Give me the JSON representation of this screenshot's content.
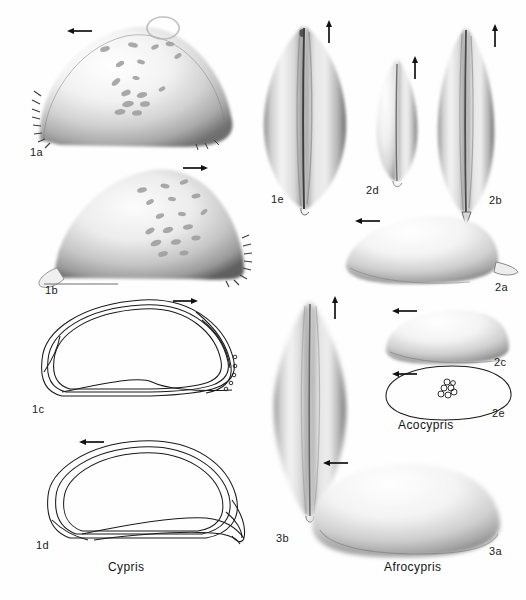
{
  "plate": {
    "width": 526,
    "height": 600,
    "background": "#ffffff",
    "ink": "#1a1a1a",
    "style": "grayscale airbrush scientific illustration of ostracod carapaces"
  },
  "genera": [
    {
      "id": "cypris",
      "label": "Cypris",
      "x": 108,
      "y": 566
    },
    {
      "id": "acocypris",
      "label": "Acocypris",
      "x": 398,
      "y": 424
    },
    {
      "id": "afrocypris",
      "label": "Afrocypris",
      "x": 384,
      "y": 566
    }
  ],
  "figures": [
    {
      "id": "1a",
      "label": "1a",
      "label_x": 30,
      "label_y": 152,
      "view": "lateral",
      "taxon": "Cypris",
      "spines": true,
      "pits": true,
      "arrow": {
        "dir": "left",
        "x": 67,
        "y": 26
      },
      "cx": 131,
      "cy": 86,
      "rx": 96,
      "ry": 58
    },
    {
      "id": "1b",
      "label": "1b",
      "label_x": 45,
      "label_y": 290,
      "view": "lateral",
      "taxon": "Cypris",
      "spines": true,
      "pits": true,
      "arrow": {
        "dir": "right",
        "x": 182,
        "y": 163
      },
      "cx": 148,
      "cy": 221,
      "rx": 95,
      "ry": 56
    },
    {
      "id": "1c",
      "label": "1c",
      "label_x": 32,
      "label_y": 409,
      "view": "outline",
      "taxon": "Cypris",
      "arrow": {
        "dir": "right",
        "x": 172,
        "y": 296
      },
      "cx": 136,
      "cy": 352,
      "rx": 98,
      "ry": 52
    },
    {
      "id": "1d",
      "label": "1d",
      "label_x": 36,
      "label_y": 545,
      "view": "outline",
      "taxon": "Cypris",
      "arrow": {
        "dir": "left",
        "x": 79,
        "y": 437
      },
      "cx": 140,
      "cy": 492,
      "rx": 95,
      "ry": 52
    },
    {
      "id": "1e",
      "label": "1e",
      "label_x": 271,
      "label_y": 199,
      "view": "dorsal",
      "taxon": "Cypris",
      "arrow": {
        "dir": "up",
        "x": 324,
        "y": 20
      },
      "cx": 304,
      "cy": 112,
      "rx": 42,
      "ry": 100
    },
    {
      "id": "2d",
      "label": "2d",
      "label_x": 366,
      "label_y": 190,
      "view": "dorsal",
      "taxon": "Acocypris",
      "arrow": {
        "dir": "up",
        "x": 410,
        "y": 56
      },
      "cx": 397,
      "cy": 117,
      "rx": 22,
      "ry": 63
    },
    {
      "id": "2b",
      "label": "2b",
      "label_x": 489,
      "label_y": 200,
      "view": "dorsal",
      "taxon": "Acocypris",
      "arrow": {
        "dir": "up",
        "x": 490,
        "y": 24
      },
      "cx": 466,
      "cy": 118,
      "rx": 30,
      "ry": 95
    },
    {
      "id": "2a",
      "label": "2a",
      "label_x": 495,
      "label_y": 287,
      "view": "lateral",
      "taxon": "Acocypris",
      "arrow": {
        "dir": "left",
        "x": 355,
        "y": 216
      },
      "cx": 422,
      "cy": 250,
      "rx": 77,
      "ry": 34
    },
    {
      "id": "2c",
      "label": "2c",
      "label_x": 494,
      "label_y": 362,
      "view": "lateral",
      "taxon": "Acocypris",
      "arrow": {
        "dir": "left",
        "x": 392,
        "y": 306
      },
      "cx": 447,
      "cy": 337,
      "rx": 62,
      "ry": 27
    },
    {
      "id": "2e",
      "label": "2e",
      "label_x": 492,
      "label_y": 413,
      "view": "outline",
      "taxon": "Acocypris",
      "muscle_scars": true,
      "arrow": {
        "dir": "left",
        "x": 392,
        "y": 369
      },
      "cx": 448,
      "cy": 394,
      "rx": 63,
      "ry": 27
    },
    {
      "id": "3b",
      "label": "3b",
      "label_x": 276,
      "label_y": 538,
      "view": "dorsal",
      "taxon": "Afrocypris",
      "arrow": {
        "dir": "up",
        "x": 330,
        "y": 296
      },
      "cx": 310,
      "cy": 410,
      "rx": 40,
      "ry": 108
    },
    {
      "id": "3a",
      "label": "3a",
      "label_x": 489,
      "label_y": 551,
      "view": "lateral",
      "taxon": "Afrocypris",
      "arrow": {
        "dir": "left",
        "x": 323,
        "y": 458
      },
      "cx": 405,
      "cy": 511,
      "rx": 95,
      "ry": 47
    }
  ]
}
